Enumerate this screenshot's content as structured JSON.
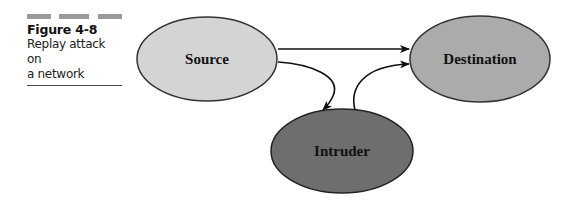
{
  "caption": {
    "figure_number": "Figure 4-8",
    "title_line1": "Replay attack on",
    "title_line2": "a network"
  },
  "nodes": {
    "source": {
      "label": "Source",
      "fill": "#d4d4d4"
    },
    "destination": {
      "label": "Destination",
      "fill": "#ababab"
    },
    "intruder": {
      "label": "Intruder",
      "fill": "#6e6e6e"
    }
  },
  "edges": [
    {
      "from": "Source",
      "to": "Destination",
      "style": "straight"
    },
    {
      "from": "Source",
      "to": "Intruder",
      "style": "curved"
    },
    {
      "from": "Intruder",
      "to": "Destination",
      "style": "curved"
    }
  ]
}
